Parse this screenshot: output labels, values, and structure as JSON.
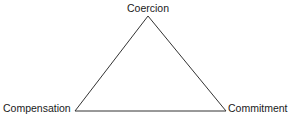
{
  "diagram": {
    "title": "",
    "nodes": [
      {
        "id": "top",
        "label": "Coercion"
      },
      {
        "id": "left",
        "label": "Compensation"
      },
      {
        "id": "right",
        "label": "Commitment"
      }
    ],
    "edges": [
      {
        "from": "top",
        "to": "left"
      },
      {
        "from": "top",
        "to": "right"
      },
      {
        "from": "left",
        "to": "right"
      }
    ],
    "line_color": "#333333"
  }
}
